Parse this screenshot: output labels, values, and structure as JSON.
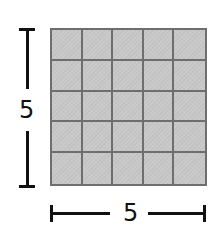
{
  "diagram": {
    "type": "square-grid-with-dimensions",
    "rows": 5,
    "columns": 5,
    "height_label": "5",
    "width_label": "5",
    "colors": {
      "cell_fill": "#c8c8c8",
      "grid_line": "#6e6e6e",
      "dimension_line": "#111111",
      "background": "#ffffff"
    }
  }
}
